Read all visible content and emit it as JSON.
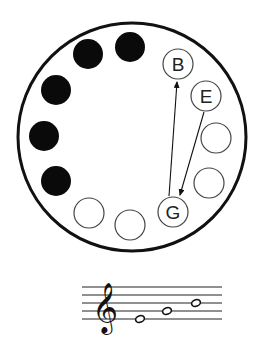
{
  "diagram": {
    "outer_circle": {
      "cx": 132,
      "cy": 137,
      "r": 114
    },
    "positions": [
      {
        "id": "p1",
        "cx": 130,
        "cy": 47,
        "filled": true,
        "label": ""
      },
      {
        "id": "p2",
        "cx": 88,
        "cy": 54,
        "filled": true,
        "label": ""
      },
      {
        "id": "p3",
        "cx": 56,
        "cy": 90,
        "filled": true,
        "label": ""
      },
      {
        "id": "p4",
        "cx": 44,
        "cy": 136,
        "filled": true,
        "label": ""
      },
      {
        "id": "p5",
        "cx": 56,
        "cy": 181,
        "filled": true,
        "label": ""
      },
      {
        "id": "p6",
        "cx": 89,
        "cy": 213,
        "filled": false,
        "label": ""
      },
      {
        "id": "p7",
        "cx": 130,
        "cy": 225,
        "filled": false,
        "label": ""
      },
      {
        "id": "p8",
        "cx": 173,
        "cy": 212,
        "filled": false,
        "label": "G"
      },
      {
        "id": "p9",
        "cx": 209,
        "cy": 183,
        "filled": false,
        "label": ""
      },
      {
        "id": "p10",
        "cx": 216,
        "cy": 138,
        "filled": false,
        "label": ""
      },
      {
        "id": "p11",
        "cx": 206,
        "cy": 96,
        "filled": false,
        "label": "E"
      },
      {
        "id": "p12",
        "cx": 178,
        "cy": 64,
        "filled": false,
        "label": "B"
      }
    ],
    "arrows": [
      {
        "from": "E",
        "to": "G"
      },
      {
        "from": "G",
        "to": "B"
      }
    ],
    "labels": {
      "b": "B",
      "e": "E",
      "g": "G"
    }
  },
  "staff": {
    "clef": "treble-clef",
    "clef_glyph": "𝄞",
    "notes": [
      "E4",
      "G4",
      "B4"
    ]
  }
}
